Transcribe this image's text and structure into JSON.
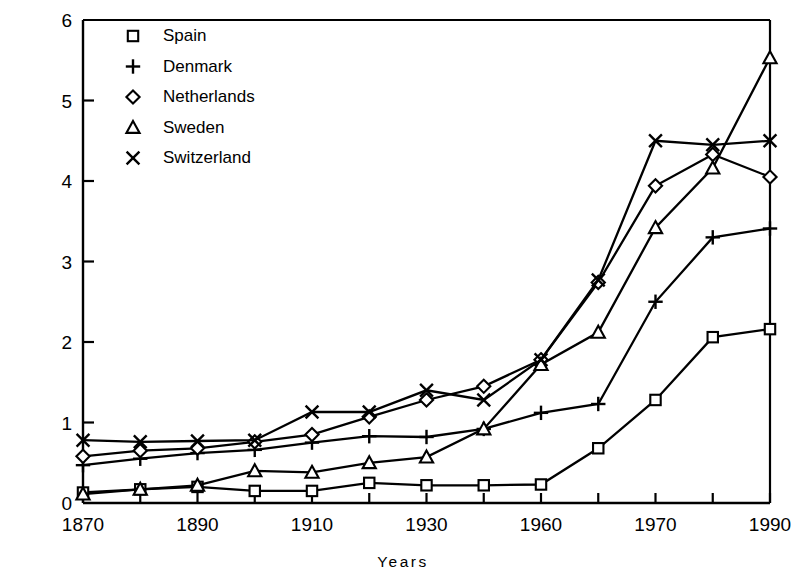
{
  "chart_data": {
    "type": "line",
    "title": "",
    "xlabel": "Years",
    "ylabel": "Ratio of manufacturing/agriculture",
    "x": [
      1870,
      1880,
      1890,
      1900,
      1910,
      1920,
      1930,
      1940,
      1960,
      1965,
      1970,
      1980,
      1987
    ],
    "xticklabels": [
      "1870",
      "",
      "1890",
      "",
      "1910",
      "",
      "1930",
      "",
      "1960",
      "",
      "1970",
      "",
      "1990"
    ],
    "xtick_values": [
      1870,
      1880,
      1890,
      1900,
      1910,
      1920,
      1930,
      1940,
      1960,
      1965,
      1970,
      1980,
      1990
    ],
    "xlim": [
      1870,
      1990
    ],
    "ylim": [
      0,
      6
    ],
    "yticks": [
      0,
      1,
      2,
      3,
      4,
      5,
      6
    ],
    "yticklabels": [
      "0",
      "1",
      "2",
      "3",
      "4",
      "5",
      "6"
    ],
    "grid": false,
    "legend_position": "upper-left-inside",
    "note": "X axis tick spacing is uniform in index, not in calendar years; ticks run 1870,1880,1890,1900,1910,1920,1930,1940,1960,1965,1970,1980,1990. Final data point for each series sits slightly left of the 1990 tick (approx 1987).",
    "series": [
      {
        "name": "Spain",
        "marker": "square",
        "marker_glyph": "□",
        "values": [
          0.13,
          0.17,
          0.2,
          0.15,
          0.15,
          0.25,
          0.22,
          0.22,
          0.23,
          0.68,
          1.28,
          2.06,
          2.16
        ]
      },
      {
        "name": "Denmark",
        "marker": "plus",
        "marker_glyph": "+",
        "values": [
          0.47,
          0.55,
          0.62,
          0.66,
          0.75,
          0.83,
          0.82,
          0.92,
          1.12,
          1.23,
          2.5,
          3.3,
          3.41
        ]
      },
      {
        "name": "Netherlands",
        "marker": "diamond",
        "marker_glyph": "◇",
        "values": [
          0.58,
          0.65,
          0.68,
          0.76,
          0.85,
          1.07,
          1.28,
          1.45,
          1.78,
          2.74,
          3.94,
          4.33,
          4.05
        ]
      },
      {
        "name": "Sweden",
        "marker": "triangle",
        "marker_glyph": "△",
        "values": [
          0.11,
          0.17,
          0.22,
          0.4,
          0.38,
          0.5,
          0.57,
          0.92,
          1.72,
          2.12,
          3.42,
          4.16,
          5.53
        ]
      },
      {
        "name": "Switzerland",
        "marker": "cross",
        "marker_glyph": "×",
        "values": [
          0.78,
          0.76,
          0.77,
          0.78,
          1.13,
          1.13,
          1.4,
          1.28,
          1.78,
          2.77,
          4.5,
          4.45,
          4.5
        ]
      }
    ]
  },
  "legend": {
    "items": [
      {
        "label": "Spain",
        "marker": "square"
      },
      {
        "label": "Denmark",
        "marker": "plus"
      },
      {
        "label": "Netherlands",
        "marker": "diamond"
      },
      {
        "label": "Sweden",
        "marker": "triangle"
      },
      {
        "label": "Switzerland",
        "marker": "cross"
      }
    ]
  },
  "colors": {
    "line": "#000000",
    "axis": "#000000",
    "background": "#ffffff"
  }
}
